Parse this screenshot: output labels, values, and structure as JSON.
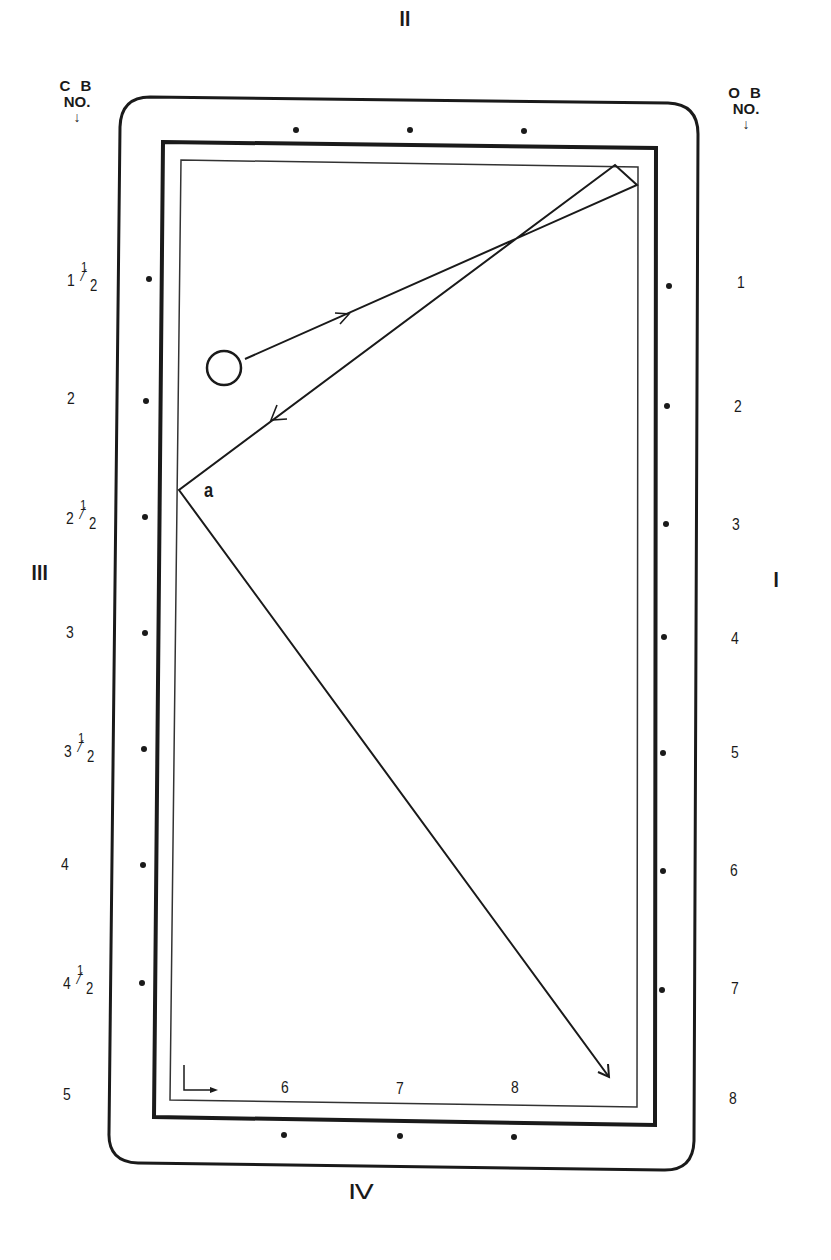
{
  "diagram": {
    "type": "billiard-table-diagram",
    "rails": {
      "I": "Ⅰ",
      "II": "Ⅱ",
      "III": "Ⅲ",
      "IV": "Ⅳ"
    },
    "headers": {
      "cue_ball": {
        "line1": "C B",
        "line2": "NO.",
        "arrow": "↓"
      },
      "object_ball": {
        "line1": "O B",
        "line2": "NO.",
        "arrow": "↓"
      }
    },
    "cue_ball_numbers": [
      {
        "whole": "1",
        "fraction": true,
        "num": "1",
        "den": "2"
      },
      {
        "whole": "2",
        "fraction": false
      },
      {
        "whole": "2",
        "fraction": true,
        "num": "1",
        "den": "2"
      },
      {
        "whole": "3",
        "fraction": false
      },
      {
        "whole": "3",
        "fraction": true,
        "num": "1",
        "den": "2"
      },
      {
        "whole": "4",
        "fraction": false
      },
      {
        "whole": "4",
        "fraction": true,
        "num": "1",
        "den": "2"
      },
      {
        "whole": "5",
        "fraction": false
      }
    ],
    "object_ball_numbers": [
      "1",
      "2",
      "3",
      "4",
      "5",
      "6",
      "7",
      "8"
    ],
    "bottom_numbers": [
      "6",
      "7",
      "8"
    ],
    "point_label": "a",
    "colors": {
      "line": "#1a1a1a",
      "background": "#ffffff"
    },
    "ball_path": [
      {
        "x": 245,
        "y": 359
      },
      {
        "x": 637,
        "y": 185
      },
      {
        "x": 615,
        "y": 165
      },
      {
        "x": 179,
        "y": 490
      },
      {
        "x": 609,
        "y": 1077
      }
    ]
  }
}
